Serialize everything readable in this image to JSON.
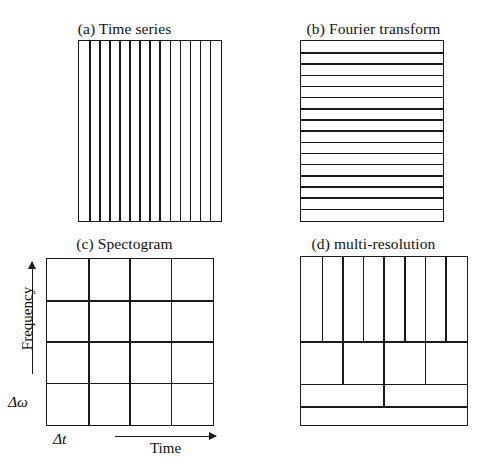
{
  "figure": {
    "caption_style": "four-panel time-frequency tiling comparison",
    "line_color": "#1a1a1a",
    "background_color": "#ffffff"
  },
  "panels": {
    "a": {
      "title": "(a) Time series",
      "box": {
        "x": 78,
        "y": 40,
        "width": 144,
        "height": 182
      },
      "tiling": "vertical-strips",
      "internal_vertical_lines": 13,
      "columns": 14,
      "internal_horizontal_lines": 0,
      "rows": 1,
      "description": "Full frequency resolution is traded away; each tile is one time sample spanning all frequencies."
    },
    "b": {
      "title": "(b) Fourier transform",
      "box": {
        "x": 300,
        "y": 40,
        "width": 144,
        "height": 182
      },
      "tiling": "horizontal-strips",
      "internal_vertical_lines": 0,
      "columns": 1,
      "internal_horizontal_lines": 15,
      "rows": 16,
      "description": "Full time resolution is traded away; each tile is one frequency bin spanning all time."
    },
    "c": {
      "title": "(c) Spectogram",
      "box": {
        "x": 46,
        "y": 258,
        "width": 168,
        "height": 168
      },
      "tiling": "uniform-grid",
      "internal_vertical_lines": 3,
      "columns": 4,
      "internal_horizontal_lines": 3,
      "rows": 4,
      "description": "Uniform time-frequency tiling: every tile has the same width and height.",
      "axes": {
        "y_label": "Frequency",
        "x_label": "Time",
        "y_resolution_label": "Δω",
        "x_resolution_label": "Δt"
      }
    },
    "d": {
      "title": "(d) multi-resolution",
      "box": {
        "x": 300,
        "y": 256,
        "width": 168,
        "height": 170
      },
      "tiling": "dyadic-wavelet",
      "rows": [
        {
          "index": 1,
          "height_fraction": 0.505,
          "columns": 8
        },
        {
          "index": 2,
          "height_fraction": 0.255,
          "columns": 4
        },
        {
          "index": 3,
          "height_fraction": 0.135,
          "columns": 2
        },
        {
          "index": 4,
          "height_fraction": 0.105,
          "columns": 1
        }
      ],
      "description": "Dyadic wavelet tiling: high frequency bands have fine time resolution, low frequency bands have fine frequency resolution."
    }
  }
}
